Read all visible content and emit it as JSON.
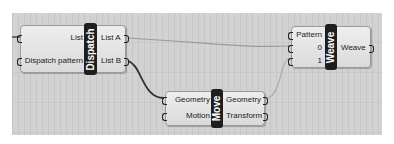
{
  "canvas": {
    "background": "#d2d2d2",
    "components": {
      "dispatch": {
        "title": "Dispatch",
        "inputs": [
          "List",
          "Dispatch pattern"
        ],
        "outputs": [
          "List A",
          "List B"
        ]
      },
      "move": {
        "title": "Move",
        "inputs": [
          "Geometry",
          "Motion"
        ],
        "outputs": [
          "Geometry",
          "Transform"
        ]
      },
      "weave": {
        "title": "Weave",
        "inputs": [
          "Pattern",
          "0",
          "1"
        ],
        "outputs": [
          "Weave"
        ]
      }
    },
    "wires": [
      {
        "from": "dispatch.List A",
        "to": "weave.0"
      },
      {
        "from": "dispatch.List B",
        "to": "move.Geometry"
      },
      {
        "from": "move.Geometry",
        "to": "weave.1"
      }
    ]
  }
}
